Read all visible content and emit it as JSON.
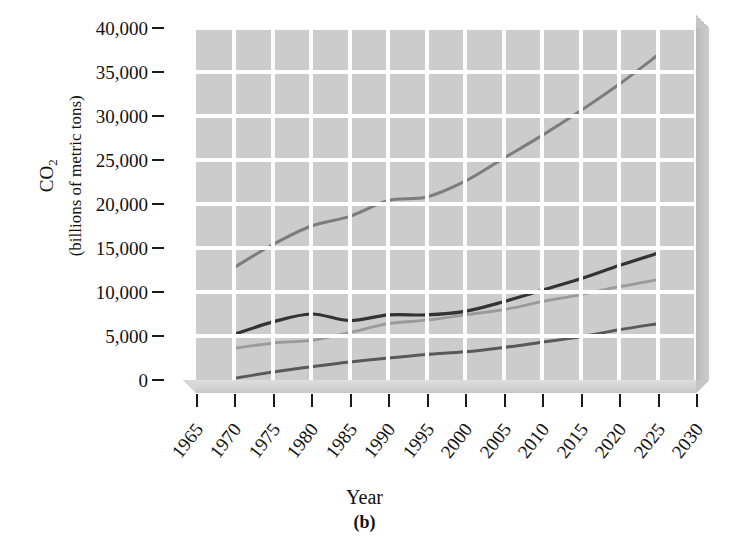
{
  "figure": {
    "panel_label": "(b)",
    "x_axis_title": "Year",
    "y_axis_title_line1": "CO2",
    "y_axis_title_line2": "(billions of metric tons)"
  },
  "chart_data": {
    "type": "line",
    "title": "",
    "xlabel": "Year",
    "ylabel": "CO2 (billions of metric tons)",
    "xlim": [
      1965,
      2030
    ],
    "ylim": [
      0,
      40000
    ],
    "xticks": [
      1965,
      1970,
      1975,
      1980,
      1985,
      1990,
      1995,
      2000,
      2005,
      2010,
      2015,
      2020,
      2025,
      2030
    ],
    "ytick_labels": [
      "40,000",
      "35,000",
      "30,000",
      "25,000",
      "20,000",
      "15,000",
      "10,000",
      "5,000",
      "0"
    ],
    "yticks": [
      40000,
      35000,
      30000,
      25000,
      20000,
      15000,
      10000,
      5000,
      0
    ],
    "grid": true,
    "legend": "none",
    "x": [
      1970,
      1975,
      1980,
      1985,
      1990,
      1995,
      2000,
      2005,
      2010,
      2015,
      2020,
      2025
    ],
    "series": [
      {
        "name": "world-total",
        "color": "#7d7d7d",
        "width": 3.0,
        "values": [
          12800,
          15400,
          17500,
          18600,
          20400,
          20800,
          22600,
          25200,
          27800,
          30600,
          33600,
          36900
        ]
      },
      {
        "name": "upper-dark",
        "color": "#333333",
        "width": 3.2,
        "values": [
          5200,
          6600,
          7500,
          6750,
          7400,
          7400,
          7800,
          8900,
          10200,
          11500,
          13000,
          14400
        ]
      },
      {
        "name": "middle-light",
        "color": "#9a9a9a",
        "width": 2.8,
        "values": [
          3600,
          4200,
          4500,
          5400,
          6400,
          6800,
          7400,
          8000,
          8900,
          9700,
          10600,
          11400
        ]
      },
      {
        "name": "lower-mid",
        "color": "#595959",
        "width": 3.0,
        "values": [
          200,
          900,
          1500,
          2050,
          2500,
          2900,
          3200,
          3700,
          4300,
          4900,
          5700,
          6400
        ]
      }
    ]
  },
  "colors": {
    "plot_background": "#cccccc",
    "gridline": "#fdfdfd",
    "bevel": "#c6c6c6",
    "axis": "#1a1a1a"
  }
}
